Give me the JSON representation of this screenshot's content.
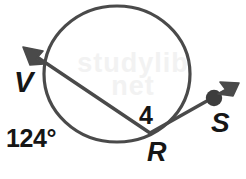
{
  "figure": {
    "background_color": "#ffffff",
    "stroke_color": "#4a4a4a",
    "label_color": "#161616",
    "labels": {
      "vertex_V": "V",
      "point_R": "R",
      "point_S": "S",
      "segment_length": "4",
      "arc_measure": "124°"
    },
    "watermark": {
      "line1": "studylib",
      "line2": "net"
    },
    "geometry": {
      "circle": {
        "cx": 117,
        "cy": 74,
        "r": 68
      },
      "secant_ray": {
        "from_point": "R",
        "through_point": "V",
        "tip_x": 23,
        "tip_y": 47,
        "R_x": 150,
        "R_y": 133
      },
      "exterior_ray": {
        "from_point": "R",
        "through_point": "S",
        "dot_x": 214,
        "dot_y": 98,
        "tip_x": 239,
        "tip_y": 83
      }
    }
  }
}
